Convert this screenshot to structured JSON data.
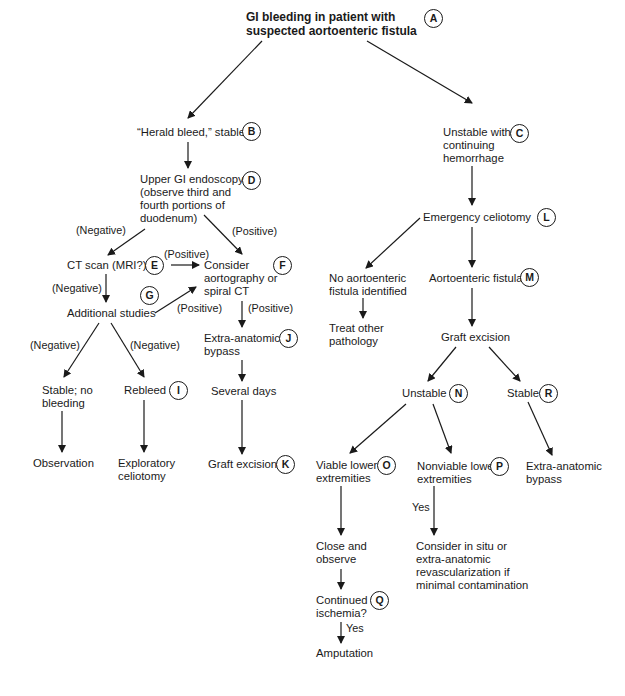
{
  "diagram": {
    "type": "flowchart",
    "title": "GI bleeding in patient with suspected aortoenteric fistula",
    "nodes": {
      "A": {
        "id": "A",
        "text": "GI bleeding in patient with\nsuspected aortoenteric fistula"
      },
      "B": {
        "id": "B",
        "text": "“Herald bleed,” stable"
      },
      "C": {
        "id": "C",
        "text": "Unstable with\ncontinuing\nhemorrhage"
      },
      "D": {
        "id": "D",
        "text": "Upper GI endoscopy\n(observe third and\nfourth portions of\nduodenum)"
      },
      "E": {
        "id": "E",
        "text": "CT scan (MRI?)"
      },
      "F": {
        "id": "F",
        "text": "Consider\naortography or\nspiral CT"
      },
      "G": {
        "id": "G",
        "text": "Additional studies"
      },
      "stable_no_bleeding": {
        "text": "Stable; no\nbleeding"
      },
      "I": {
        "id": "I",
        "text": "Rebleed"
      },
      "J": {
        "id": "J",
        "text": "Extra-anatomic\nbypass"
      },
      "several_days": {
        "text": "Several days"
      },
      "observation": {
        "text": "Observation"
      },
      "exploratory_celiotomy": {
        "text": "Exploratory\nceliotomy"
      },
      "K": {
        "id": "K",
        "text": "Graft excision"
      },
      "L": {
        "id": "L",
        "text": "Emergency celiotomy"
      },
      "no_fistula": {
        "text": "No aortoenteric\nfistula identified"
      },
      "M": {
        "id": "M",
        "text": "Aortoenteric fistula"
      },
      "treat_other": {
        "text": "Treat other\npathology"
      },
      "graft_excision_right": {
        "text": "Graft excision"
      },
      "N": {
        "id": "N",
        "text": "Unstable"
      },
      "R": {
        "id": "R",
        "text": "Stable"
      },
      "extra_anatomic_bypass_right": {
        "text": "Extra-anatomic\nbypass"
      },
      "O": {
        "id": "O",
        "text": "Viable lower\nextremities"
      },
      "P": {
        "id": "P",
        "text": "Nonviable lower\nextremities"
      },
      "close_observe": {
        "text": "Close and\nobserve"
      },
      "consider_in_situ": {
        "text": "Consider in situ or\nextra-anatomic\nrevascularization if\nminimal contamination"
      },
      "Q": {
        "id": "Q",
        "text": "Continued\nischemia?"
      },
      "amputation": {
        "text": "Amputation"
      }
    },
    "edge_labels": {
      "d_to_e": "(Negative)",
      "d_to_f": "(Positive)",
      "e_to_f": "(Positive)",
      "e_to_g": "(Negative)",
      "g_to_f": "(Positive)",
      "f_to_j": "(Positive)",
      "g_to_stable": "(Negative)",
      "g_to_rebleed": "(Negative)",
      "p_to_consider": "Yes",
      "q_to_amputation": "Yes"
    },
    "edges": [
      [
        "A",
        "B"
      ],
      [
        "A",
        "C"
      ],
      [
        "B",
        "D"
      ],
      [
        "D",
        "E"
      ],
      [
        "D",
        "F"
      ],
      [
        "E",
        "F"
      ],
      [
        "E",
        "G"
      ],
      [
        "G",
        "F"
      ],
      [
        "F",
        "J"
      ],
      [
        "J",
        "several_days"
      ],
      [
        "several_days",
        "K"
      ],
      [
        "G",
        "stable_no_bleeding"
      ],
      [
        "G",
        "I"
      ],
      [
        "stable_no_bleeding",
        "observation"
      ],
      [
        "I",
        "exploratory_celiotomy"
      ],
      [
        "C",
        "L"
      ],
      [
        "L",
        "no_fistula"
      ],
      [
        "L",
        "M"
      ],
      [
        "no_fistula",
        "treat_other"
      ],
      [
        "M",
        "graft_excision_right"
      ],
      [
        "graft_excision_right",
        "N"
      ],
      [
        "graft_excision_right",
        "R"
      ],
      [
        "R",
        "extra_anatomic_bypass_right"
      ],
      [
        "N",
        "O"
      ],
      [
        "N",
        "P"
      ],
      [
        "O",
        "close_observe"
      ],
      [
        "P",
        "consider_in_situ"
      ],
      [
        "close_observe",
        "Q"
      ],
      [
        "Q",
        "amputation"
      ]
    ]
  }
}
